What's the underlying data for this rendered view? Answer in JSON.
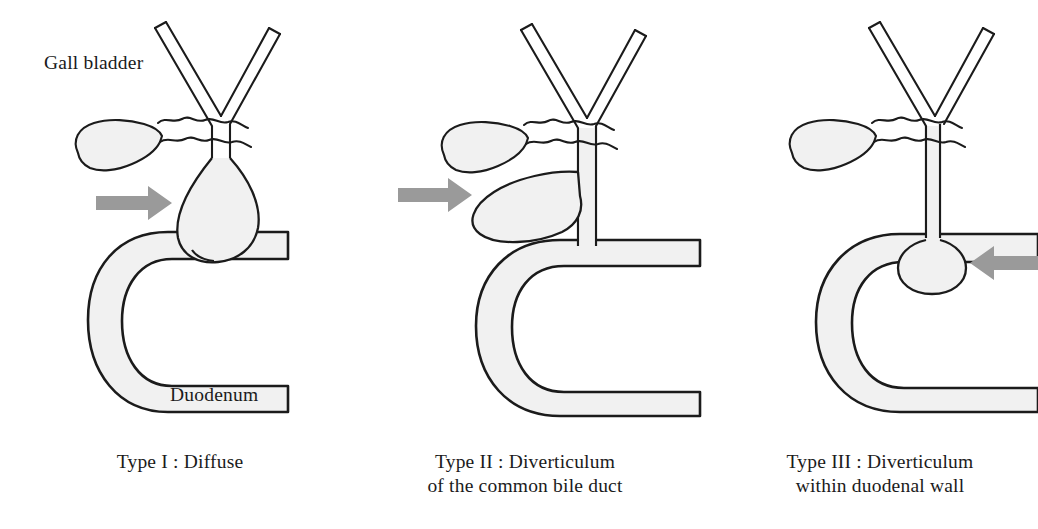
{
  "figure": {
    "title_type": "medical-diagram",
    "background_color": "#ffffff",
    "ink_color": "#1b1b1b",
    "organ_fill_color": "#f1f1f1",
    "arrow_color": "#9a9a9a"
  },
  "labels": {
    "gall_bladder": "Gall bladder",
    "duodenum": "Duodenum"
  },
  "panels": [
    {
      "id": "type-1",
      "caption": "Type I : Diffuse",
      "caption_lines": [
        "Type I : Diffuse"
      ],
      "arrow_direction": "right",
      "cyst_shape": "fusiform dilation of common bile duct",
      "has_gall_bladder": true,
      "has_duodenum": true,
      "has_hepatic_duct_y": true
    },
    {
      "id": "type-2",
      "caption": "Type II : Diverticulum\nof the common bile duct",
      "caption_lines": [
        "Type II : Diverticulum",
        "of the common bile duct"
      ],
      "arrow_direction": "right",
      "cyst_shape": "lateral saccular diverticulum",
      "has_gall_bladder": true,
      "has_duodenum": true,
      "has_hepatic_duct_y": true
    },
    {
      "id": "type-3",
      "caption": "Type III : Diverticulum\nwithin duodenal wall",
      "caption_lines": [
        "Type III : Diverticulum",
        "within duodenal wall"
      ],
      "arrow_direction": "left",
      "cyst_shape": "choledochocele within duodenal wall",
      "has_gall_bladder": true,
      "has_duodenum": true,
      "has_hepatic_duct_y": true
    }
  ]
}
